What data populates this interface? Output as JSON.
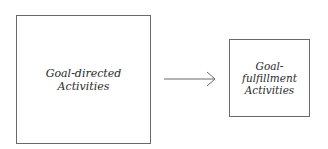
{
  "diagram": {
    "nodes": [
      {
        "id": "goal-directed",
        "lines": [
          "Goal-directed",
          "Activities"
        ]
      },
      {
        "id": "goal-fulfillment",
        "lines": [
          "Goal-",
          "fulfillment",
          "Activities"
        ]
      }
    ],
    "edges": [
      {
        "from": "goal-directed",
        "to": "goal-fulfillment",
        "type": "arrow"
      }
    ],
    "colors": {
      "stroke": "#6a6a6a",
      "text": "#2a2a2a",
      "background": "#ffffff"
    }
  }
}
